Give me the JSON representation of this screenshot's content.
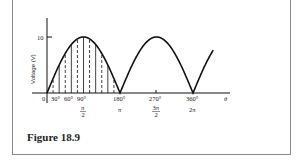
{
  "figure": {
    "caption": "Figure 18.9"
  },
  "chart_data": {
    "type": "line",
    "title": "",
    "xlabel": "θ",
    "ylabel": "Voltage (V)",
    "x_unit": "degrees",
    "xlim": [
      0,
      420
    ],
    "ylim": [
      0,
      10
    ],
    "grid": false,
    "legend": null,
    "y_ticks": [
      {
        "value": 10,
        "label": "10"
      }
    ],
    "x_ticks": [
      {
        "value": 0,
        "label": "0",
        "radian_label": ""
      },
      {
        "value": 30,
        "label": "30°",
        "radian_label": ""
      },
      {
        "value": 60,
        "label": "60°",
        "radian_label": ""
      },
      {
        "value": 90,
        "label": "90°",
        "radian_label": "π/2"
      },
      {
        "value": 180,
        "label": "180°",
        "radian_label": "π"
      },
      {
        "value": 270,
        "label": "270°",
        "radian_label": "3π/2"
      },
      {
        "value": 360,
        "label": "360°",
        "radian_label": "2π"
      }
    ],
    "series": [
      {
        "name": "Full-wave rectified sine |10 sin θ|",
        "x": [
          0,
          30,
          60,
          90,
          120,
          150,
          180,
          210,
          240,
          270,
          300,
          330,
          360,
          390,
          410
        ],
        "values": [
          0,
          5,
          8.66,
          10,
          8.66,
          5,
          0,
          5,
          8.66,
          10,
          8.66,
          5,
          0,
          5,
          7.7
        ]
      }
    ],
    "annotations": [
      "First half-cycle (0°–180°) filled with alternating solid and dashed vertical strips representing sampled ordinates"
    ],
    "axis_labels": {
      "zero": "0",
      "theta": "θ",
      "y_tick_10": "10",
      "deg30": "30°",
      "deg60": "60°",
      "deg90": "90°",
      "deg180": "180°",
      "deg270": "270°",
      "deg360": "360°",
      "pi_over_2_num": "π",
      "pi_over_2_den": "2",
      "pi": "π",
      "three_pi_over_2_num": "3π",
      "three_pi_over_2_den": "2",
      "two_pi": "2π"
    }
  }
}
